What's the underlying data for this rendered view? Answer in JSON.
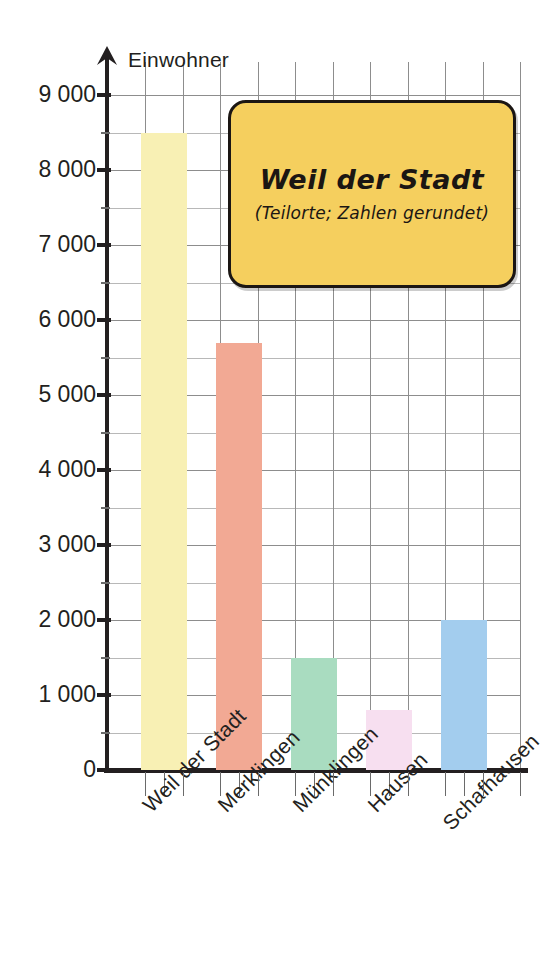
{
  "chart_data": {
    "type": "bar",
    "title": "Weil der Stadt",
    "subtitle": "(Teilorte; Zahlen gerundet)",
    "xlabel": "",
    "ylabel": "Einwohner",
    "ylim": [
      0,
      9000
    ],
    "grid": true,
    "legend": "none",
    "y_major_step": 1000,
    "y_minor_step": 500,
    "categories": [
      "Weil der Stadt",
      "Merklingen",
      "Münklingen",
      "Hausen",
      "Schafhausen"
    ],
    "values": [
      8500,
      5700,
      1500,
      800,
      2000
    ],
    "bar_colors": [
      "#f8f0b4",
      "#f2a994",
      "#a9dcc0",
      "#f7dff0",
      "#a3cdee"
    ],
    "ytick_labels": [
      "0",
      "1 000",
      "2 000",
      "3 000",
      "4 000",
      "5 000",
      "6 000",
      "7 000",
      "8 000",
      "9 000"
    ],
    "ytick_values": [
      0,
      1000,
      2000,
      3000,
      4000,
      5000,
      6000,
      7000,
      8000,
      9000
    ]
  },
  "chart": {
    "axis_title": "Einwohner",
    "arrow_icon": "up-arrow-icon"
  },
  "callout": {
    "title": "Weil der Stadt",
    "subtitle": "(Teilorte; Zahlen gerundet)",
    "background_color": "#f5cf5e",
    "border_color": "#1b1613"
  }
}
